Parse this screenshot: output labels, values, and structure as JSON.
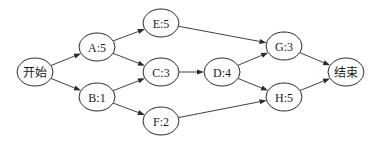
{
  "diagram": {
    "type": "activity-network",
    "nodes": [
      {
        "id": "start",
        "label": "开始"
      },
      {
        "id": "A",
        "label": "A:5"
      },
      {
        "id": "B",
        "label": "B:1"
      },
      {
        "id": "E",
        "label": "E:5"
      },
      {
        "id": "C",
        "label": "C:3"
      },
      {
        "id": "F",
        "label": "F:2"
      },
      {
        "id": "D",
        "label": "D:4"
      },
      {
        "id": "G",
        "label": "G:3"
      },
      {
        "id": "H",
        "label": "H:5"
      },
      {
        "id": "end",
        "label": "结束"
      }
    ],
    "edges": [
      {
        "from": "start",
        "to": "A"
      },
      {
        "from": "start",
        "to": "B"
      },
      {
        "from": "A",
        "to": "E"
      },
      {
        "from": "A",
        "to": "C"
      },
      {
        "from": "B",
        "to": "C"
      },
      {
        "from": "B",
        "to": "F"
      },
      {
        "from": "E",
        "to": "G"
      },
      {
        "from": "C",
        "to": "D"
      },
      {
        "from": "D",
        "to": "G"
      },
      {
        "from": "D",
        "to": "H"
      },
      {
        "from": "F",
        "to": "H"
      },
      {
        "from": "G",
        "to": "end"
      },
      {
        "from": "H",
        "to": "end"
      }
    ]
  }
}
